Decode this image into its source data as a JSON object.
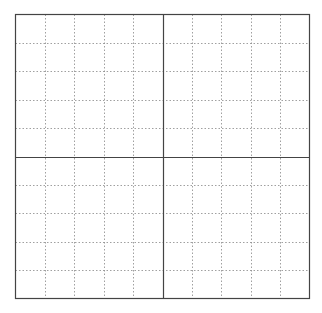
{
  "diagram": {
    "type": "grid",
    "columns": 10,
    "rows": 10,
    "box": {
      "x": 15.5,
      "y": 14.5,
      "width": 294,
      "height": 284
    },
    "colors": {
      "border": "#444444",
      "axis": "#444444",
      "minor": "#888888",
      "background": "#ffffff"
    },
    "axis_lines": {
      "vertical_index": 5,
      "horizontal_index": 5
    }
  }
}
